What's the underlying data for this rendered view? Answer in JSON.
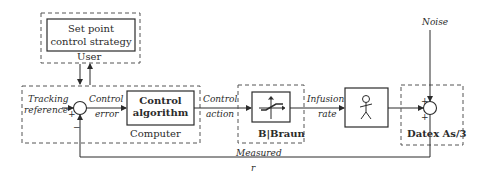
{
  "diagram": {
    "user_block": {
      "container_label": "User",
      "inner_box_line1": "Set point",
      "inner_box_line2": "control strategy"
    },
    "computer_block": {
      "container_label": "Computer",
      "input_label_line1": "Tracking",
      "input_label_line2": "reference",
      "sum_plus": "+",
      "sum_minus": "−",
      "error_label_line1": "Control",
      "error_label_line2": "error",
      "algorithm_line1": "Control",
      "algorithm_line2": "algorithm"
    },
    "action_label_line1": "Control",
    "action_label_line2": "action",
    "pump_block": {
      "container_label": "B|Braun",
      "icon": "saturation-characteristic-icon"
    },
    "infusion_label_line1": "Infusion",
    "infusion_label_line2": "rate",
    "patient_block": {
      "icon": "stick-figure-patient-icon"
    },
    "monitor_block": {
      "container_label": "Datex As/3",
      "noise_label": "Noise",
      "sum_plus_top": "+",
      "sum_plus_left": "+"
    },
    "feedback_label_line1": "Measured",
    "feedback_label_line2": "r",
    "colors": {
      "line": "#2b2b2b",
      "dashed": "#555555",
      "background": "#ffffff"
    }
  }
}
